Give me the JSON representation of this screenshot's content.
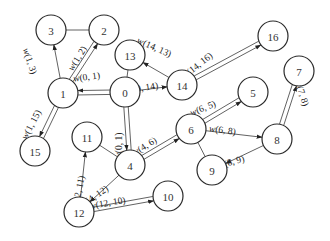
{
  "diagram": {
    "type": "weighted-graph",
    "nodes": [
      {
        "id": "0",
        "x": 125,
        "y": 92
      },
      {
        "id": "1",
        "x": 63,
        "y": 93
      },
      {
        "id": "2",
        "x": 104,
        "y": 30
      },
      {
        "id": "3",
        "x": 51,
        "y": 30
      },
      {
        "id": "4",
        "x": 130,
        "y": 165
      },
      {
        "id": "5",
        "x": 253,
        "y": 92
      },
      {
        "id": "6",
        "x": 191,
        "y": 129
      },
      {
        "id": "7",
        "x": 299,
        "y": 71
      },
      {
        "id": "8",
        "x": 277,
        "y": 139
      },
      {
        "id": "9",
        "x": 212,
        "y": 170
      },
      {
        "id": "10",
        "x": 168,
        "y": 196
      },
      {
        "id": "11",
        "x": 87,
        "y": 137
      },
      {
        "id": "12",
        "x": 79,
        "y": 212
      },
      {
        "id": "13",
        "x": 130,
        "y": 55
      },
      {
        "id": "14",
        "x": 182,
        "y": 85
      },
      {
        "id": "15",
        "x": 35,
        "y": 151
      },
      {
        "id": "16",
        "x": 273,
        "y": 36
      }
    ],
    "edges": [
      {
        "from": "3",
        "to": "2",
        "style": "plain"
      },
      {
        "from": "0",
        "to": "13",
        "style": "plain"
      },
      {
        "from": "11",
        "to": "4",
        "style": "plain"
      },
      {
        "from": "6",
        "to": "9",
        "style": "plain"
      },
      {
        "from": "1",
        "to": "3",
        "style": "arrow",
        "label": "w(1, 3)"
      },
      {
        "from": "1",
        "to": "2",
        "style": "double-arrow",
        "label": "w(1, 2)"
      },
      {
        "from": "0",
        "to": "1",
        "style": "double-arrow",
        "label": "w(0, 1)"
      },
      {
        "from": "1",
        "to": "15",
        "style": "double-arrow",
        "label": "w(1, 15)"
      },
      {
        "from": "0",
        "to": "14",
        "style": "arrow",
        "label": "w(0, 14)"
      },
      {
        "from": "14",
        "to": "13",
        "style": "arrow",
        "label": "w(14, 13)"
      },
      {
        "from": "14",
        "to": "16",
        "style": "double-arrow",
        "label": "w(14, 16)"
      },
      {
        "from": "0",
        "to": "4",
        "style": "double-arrow",
        "label": "w(0, 1)"
      },
      {
        "from": "4",
        "to": "6",
        "style": "double-arrow",
        "label": "w(4, 6)"
      },
      {
        "from": "6",
        "to": "5",
        "style": "double-arrow",
        "label": "w(6, 5)"
      },
      {
        "from": "6",
        "to": "8",
        "style": "arrow",
        "label": "w(6, 8)"
      },
      {
        "from": "8",
        "to": "7",
        "style": "double-arrow",
        "label": "w(7, 8)"
      },
      {
        "from": "8",
        "to": "9",
        "style": "arrow",
        "label": "w(8, 9)"
      },
      {
        "from": "12",
        "to": "11",
        "style": "arrow",
        "label": "w(12, 11)"
      },
      {
        "from": "4",
        "to": "12",
        "style": "arrow",
        "label": "w(4, 12)"
      },
      {
        "from": "12",
        "to": "10",
        "style": "double-arrow",
        "label": "w(12, 10)"
      }
    ],
    "labels": [
      {
        "text": "w(1, 3)",
        "x": 27,
        "y": 62,
        "rot": 72
      },
      {
        "text": "w(1, 2)",
        "x": 80,
        "y": 60,
        "rot": -58
      },
      {
        "text": "w(0, 1)",
        "x": 87,
        "y": 80,
        "rot": -8
      },
      {
        "text": "w(1, 15)",
        "x": 34,
        "y": 126,
        "rot": -62
      },
      {
        "text": "w(0, 14)",
        "x": 143,
        "y": 91,
        "rot": -10
      },
      {
        "text": "w(14, 13)",
        "x": 153,
        "y": 50,
        "rot": 24
      },
      {
        "text": "w(14, 16)",
        "x": 199,
        "y": 68,
        "rot": -38
      },
      {
        "text": "w(0, 1)",
        "x": 122,
        "y": 146,
        "rot": -90
      },
      {
        "text": "w(4, 6)",
        "x": 146,
        "y": 149,
        "rot": -32
      },
      {
        "text": "w(6, 5)",
        "x": 204,
        "y": 111,
        "rot": -22
      },
      {
        "text": "w(6, 8)",
        "x": 222,
        "y": 133,
        "rot": 8
      },
      {
        "text": "w(7, 8)",
        "x": 299,
        "y": 94,
        "rot": 72
      },
      {
        "text": "w(8, 9)",
        "x": 232,
        "y": 165,
        "rot": -16
      },
      {
        "text": "w(12, 11)",
        "x": 81,
        "y": 194,
        "rot": -78
      },
      {
        "text": "w(4, 12)",
        "x": 96,
        "y": 199,
        "rot": -34
      },
      {
        "text": "w(12, 10)",
        "x": 108,
        "y": 206,
        "rot": -10
      }
    ]
  }
}
